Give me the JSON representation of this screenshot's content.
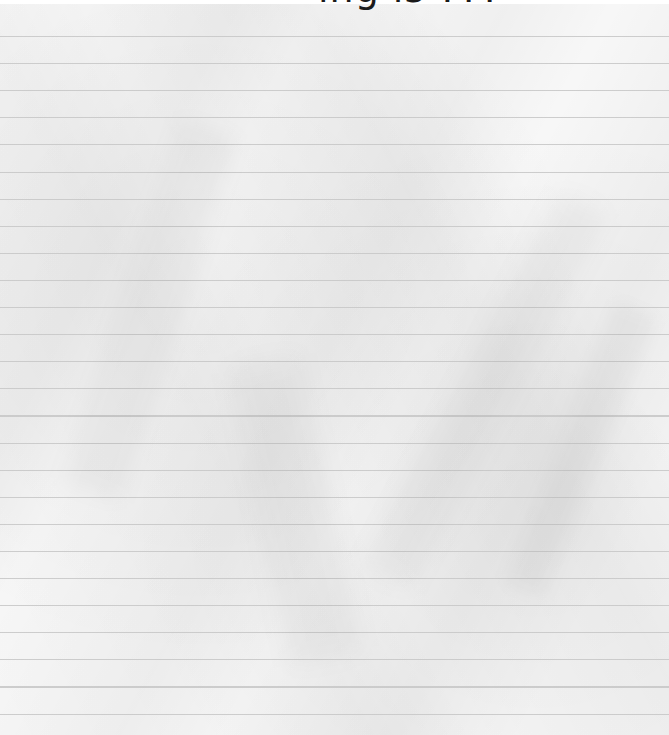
{
  "title": {
    "text": "ing is ???",
    "note": "text clipped at top edge; only glyph bottoms visible"
  },
  "paper": {
    "style": "crumpled-lined-paper",
    "background_color": "#f7f7f7",
    "rule_color": "#c8c8c8",
    "rule_spacing_px": 27,
    "first_rule_y_px": 14
  }
}
